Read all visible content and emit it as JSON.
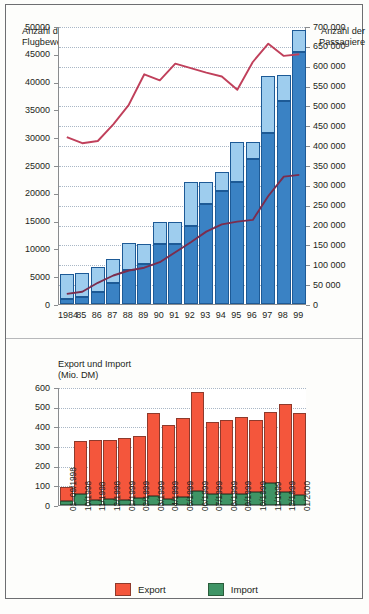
{
  "chart_data": [
    {
      "type": "bar",
      "id": "flight-chart",
      "title": "",
      "ylabel_left": "Anzahl der\nFlugbewegungen",
      "ylabel_right": "Anzahl der\nPassagiere",
      "xlabel": "",
      "categories": [
        "1984",
        "85",
        "86",
        "87",
        "88",
        "89",
        "90",
        "91",
        "92",
        "93",
        "94",
        "95",
        "96",
        "97",
        "98",
        "99"
      ],
      "ylim_left": [
        0,
        50000
      ],
      "ylim_right": [
        0,
        700000
      ],
      "yticks_left": [
        "0",
        "5000",
        "10000",
        "15000",
        "20000",
        "25000",
        "30000",
        "35000",
        "40000",
        "45000",
        "50000"
      ],
      "yticks_right": [
        "0",
        "50000",
        "100000",
        "150000",
        "200000",
        "250000",
        "300000",
        "350000",
        "400000",
        "450000",
        "500000",
        "550000",
        "600000",
        "650000",
        "700000"
      ],
      "grid": true,
      "legend_position": "inside-top",
      "legend_heading_right": "Rechte Skala:",
      "legend_heading_left": "Linke Skala:",
      "series": [
        {
          "name": "Passagiere Linienflüge",
          "axis": "right",
          "kind": "bar-stack",
          "color": "#3a82c4",
          "values": [
            12000,
            17000,
            31000,
            52000,
            85000,
            100000,
            150000,
            151000,
            197000,
            253000,
            285000,
            307000,
            365000,
            430000,
            512000,
            635000
          ]
        },
        {
          "name": "Passagiere sonstige Flüge",
          "axis": "right",
          "kind": "bar-stack",
          "color": "#9ecdee",
          "values": [
            63000,
            61000,
            62000,
            62000,
            69000,
            52000,
            57000,
            56000,
            109000,
            53000,
            48000,
            101000,
            42000,
            145000,
            64000,
            55000
          ]
        },
        {
          "name": "Flugbewegungen gesamt",
          "axis": "left",
          "kind": "line",
          "color": "#c0405b",
          "values": [
            30200,
            29100,
            29500,
            32500,
            36000,
            41500,
            40400,
            43400,
            42600,
            41800,
            41100,
            38700,
            43700,
            47000,
            44800,
            45100
          ]
        },
        {
          "name": "Flugbewegungen Linienflüge",
          "axis": "left",
          "kind": "line",
          "color": "#7b2d4e",
          "values": [
            2000,
            2400,
            4000,
            5300,
            6200,
            6700,
            7700,
            9500,
            11300,
            13200,
            14500,
            15000,
            15300,
            19600,
            23100,
            23400
          ]
        }
      ]
    },
    {
      "type": "bar",
      "id": "trade-chart",
      "title": "Export und Import\n(Mio. DM)",
      "ylabel": "Export und Import (Mio. DM)",
      "xlabel": "",
      "categories": [
        "01–09/1998",
        "10/1998",
        "11/1998",
        "12/1998",
        "01/1999",
        "02/1999",
        "03/1999",
        "04/1999",
        "05/1999",
        "06/1999",
        "07/1999",
        "08/1999",
        "09/1999",
        "10/1999",
        "11/1999",
        "12/1999",
        "01/2000"
      ],
      "ylim": [
        0,
        600
      ],
      "yticks": [
        "0",
        "100",
        "200",
        "300",
        "400",
        "500",
        "600"
      ],
      "grid": true,
      "legend_position": "bottom",
      "series": [
        {
          "name": "Export",
          "kind": "bar-stack",
          "color": "#f4563c",
          "values": [
            68,
            270,
            305,
            297,
            316,
            318,
            418,
            373,
            401,
            500,
            367,
            377,
            390,
            367,
            360,
            450,
            418
          ]
        },
        {
          "name": "Import",
          "kind": "bar-stack",
          "color": "#3f9465",
          "values": [
            22,
            55,
            25,
            32,
            23,
            34,
            48,
            32,
            41,
            73,
            55,
            57,
            58,
            65,
            113,
            64,
            51
          ]
        }
      ]
    }
  ],
  "top": {
    "axis_title_left": "Anzahl der\nFlugbewegungen",
    "axis_title_right": "Anzahl der\nPassagiere",
    "legend": {
      "right_scale_heading": "Rechte Skala:",
      "item_line_pax": "Passagiere Linienflüge",
      "item_other_pax": "Passagiere sonstige Flüge",
      "left_scale_heading": "Linke Skala:",
      "item_total_moves": "Flugbewegungen gesamt",
      "item_line_moves": "Flugbewegungen Linienflüge"
    }
  },
  "bottom": {
    "axis_title": "Export und Import\n(Mio. DM)",
    "legend": {
      "export": "Export",
      "import": "Import"
    }
  },
  "colors": {
    "line_pax": "#3a82c4",
    "other_pax": "#9ecdee",
    "total_moves_line": "#c0405b",
    "line_moves_line": "#7b2d4e",
    "export": "#f4563c",
    "import": "#3f9465",
    "axis": "#8a8c8e",
    "grid": "#a9b7c6"
  }
}
